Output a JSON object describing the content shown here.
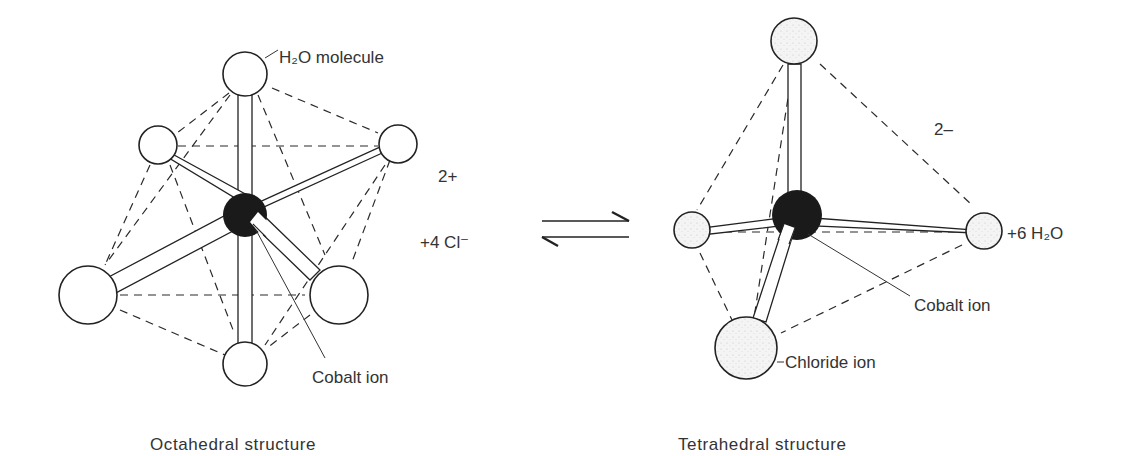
{
  "diagram": {
    "left": {
      "caption": "Octahedral structure",
      "labels": {
        "water": "H₂O molecule",
        "cobalt": "Cobalt ion",
        "charge": "2+",
        "reactant": "+4 Cl⁻"
      }
    },
    "equilibrium_symbol": "⇌",
    "right": {
      "caption": "Tetrahedral structure",
      "labels": {
        "cobalt": "Cobalt ion",
        "chloride": "Chloride ion",
        "charge": "2–",
        "product": "+6 H₂O"
      }
    },
    "colors": {
      "ink": "#222222",
      "cobalt_fill": "#1a1a1a",
      "atom_fill": "#ffffff",
      "stipple_fill": "#f2f2f2"
    }
  }
}
